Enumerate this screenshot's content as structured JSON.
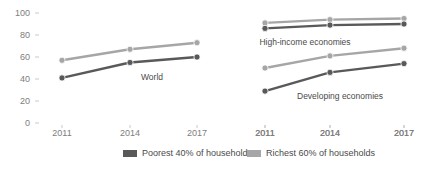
{
  "chart_data": {
    "type": "line",
    "title": "",
    "xlabel": "",
    "ylabel": "",
    "ylim": [
      0,
      100
    ],
    "ytick_values": [
      0,
      20,
      40,
      60,
      80,
      100
    ],
    "ytick_labels": [
      "0",
      "20",
      "40",
      "60",
      "80",
      "100"
    ],
    "grid": false,
    "legend_position": "bottom",
    "x": [
      "2011",
      "2014",
      "2017"
    ],
    "panels": [
      {
        "name": "world-panel",
        "annotation": "World",
        "xtick_labels": [
          "2011",
          "2014",
          "2017"
        ],
        "series": [
          {
            "name": "Poorest 40% of households",
            "values": [
              41,
              55,
              60
            ],
            "color": "#595959"
          },
          {
            "name": "Richest 60% of households",
            "values": [
              57,
              67,
              73
            ],
            "color": "#a6a6a6"
          }
        ]
      },
      {
        "name": "high-income-panel",
        "annotation": "High-income economies",
        "xtick_labels": [
          "2011",
          "2014",
          "2017"
        ],
        "series": [
          {
            "name": "Poorest 40% of households",
            "values": [
              86,
              89,
              90
            ],
            "color": "#595959"
          },
          {
            "name": "Richest 60% of households",
            "values": [
              91,
              94,
              95
            ],
            "color": "#a6a6a6"
          }
        ]
      },
      {
        "name": "developing-panel",
        "annotation": "Developing economies",
        "xtick_labels": [
          "2011",
          "2014",
          "2017"
        ],
        "series": [
          {
            "name": "Poorest 40% of households",
            "values": [
              29,
              46,
              54
            ],
            "color": "#595959"
          },
          {
            "name": "Richest 60% of households",
            "values": [
              50,
              61,
              68
            ],
            "color": "#a6a6a6"
          }
        ]
      }
    ],
    "legend": [
      {
        "label": "Poorest 40% of households",
        "color": "#595959"
      },
      {
        "label": "Richest 60% of households",
        "color": "#a6a6a6"
      }
    ]
  }
}
